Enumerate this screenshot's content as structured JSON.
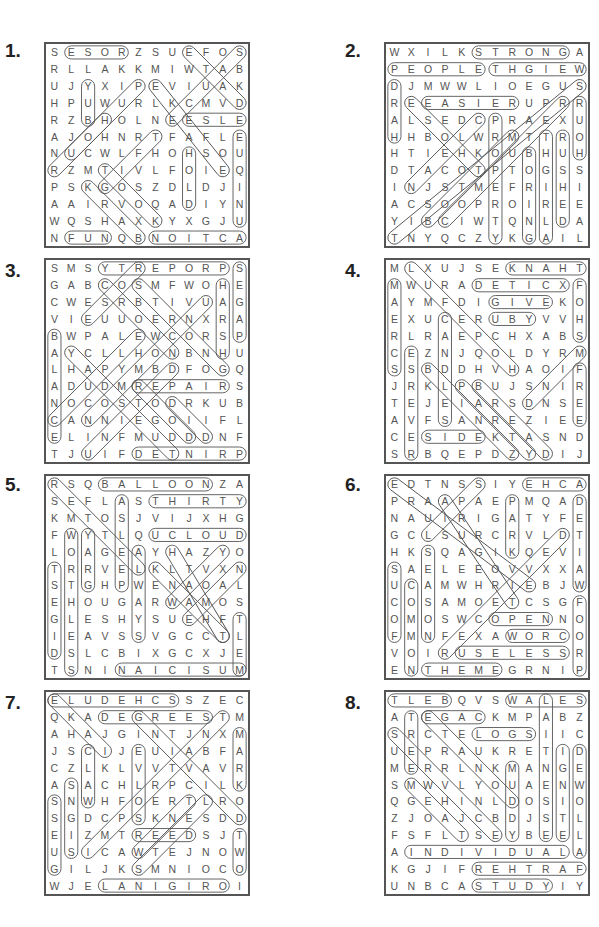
{
  "corner_text": "",
  "puzzles": [
    {
      "number": "1.",
      "rows": [
        "SESORZSUEFOS",
        "RLLAKKMIWTAB",
        "UJYXIPEVIUAK",
        "HPUWURLKCMVD",
        "RZBHOLNEESLE",
        "AJOHNRTFAFLE",
        "NUCWLFHOHSOU",
        "RZMTIVLFOIEQ",
        "PSKGOSZDLDJI",
        "AAIRVOQADIYN",
        "WQSHAXKYXGJU",
        "NFUNQBNOITCA"
      ],
      "words": [
        {
          "r1": 0,
          "c1": 1,
          "r2": 0,
          "c2": 4
        },
        {
          "r1": 0,
          "c1": 8,
          "r2": 3,
          "c2": 11
        },
        {
          "r1": 0,
          "c1": 11,
          "r2": 4,
          "c2": 7
        },
        {
          "r1": 2,
          "c1": 2,
          "r2": 4,
          "c2": 2
        },
        {
          "r1": 2,
          "c1": 6,
          "r2": 7,
          "c2": 10
        },
        {
          "r1": 2,
          "c1": 5,
          "r2": 6,
          "c2": 1
        },
        {
          "r1": 4,
          "c1": 8,
          "r2": 4,
          "c2": 11
        },
        {
          "r1": 4,
          "c1": 3,
          "r2": 7,
          "c2": 0
        },
        {
          "r1": 5,
          "c1": 11,
          "r2": 10,
          "c2": 11
        },
        {
          "r1": 5,
          "c1": 6,
          "r2": 8,
          "c2": 3
        },
        {
          "r1": 6,
          "c1": 8,
          "r2": 9,
          "c2": 8
        },
        {
          "r1": 7,
          "c1": 3,
          "r2": 10,
          "c2": 6
        },
        {
          "r1": 8,
          "c1": 2,
          "r2": 11,
          "c2": 5
        },
        {
          "r1": 11,
          "c1": 1,
          "r2": 11,
          "c2": 3
        },
        {
          "r1": 11,
          "c1": 6,
          "r2": 11,
          "c2": 11
        }
      ]
    },
    {
      "number": "2.",
      "rows": [
        "WXILKSTRONGA",
        "PEOPLETHGIEW",
        "DJMWWLIOEGUS",
        "REEASIERUPRR",
        "ALSEDCPRAEXU",
        "HHBOLWRMTTRO",
        "HTIEHKOUBHUH",
        "DTACOTPTOGSS",
        "INJSTMEFRIHI",
        "ACSOOPROIREE",
        "YIBCIWTQNLDA",
        "TNYQCZYKGAIL"
      ],
      "words": [
        {
          "r1": 0,
          "c1": 5,
          "r2": 0,
          "c2": 10
        },
        {
          "r1": 1,
          "c1": 0,
          "r2": 1,
          "c2": 5
        },
        {
          "r1": 1,
          "c1": 6,
          "r2": 1,
          "c2": 11
        },
        {
          "r1": 2,
          "c1": 0,
          "r2": 5,
          "c2": 0
        },
        {
          "r1": 3,
          "c1": 2,
          "r2": 3,
          "c2": 7
        },
        {
          "r1": 3,
          "c1": 1,
          "r2": 7,
          "c2": 5
        },
        {
          "r1": 2,
          "c1": 11,
          "r2": 11,
          "c2": 0
        },
        {
          "r1": 3,
          "c1": 11,
          "r2": 6,
          "c2": 11
        },
        {
          "r1": 4,
          "c1": 5,
          "r2": 8,
          "c2": 1
        },
        {
          "r1": 4,
          "c1": 6,
          "r2": 11,
          "c2": 6
        },
        {
          "r1": 5,
          "c1": 7,
          "r2": 10,
          "c2": 2
        },
        {
          "r1": 5,
          "c1": 9,
          "r2": 11,
          "c2": 9
        },
        {
          "r1": 5,
          "c1": 10,
          "r2": 10,
          "c2": 10
        },
        {
          "r1": 6,
          "c1": 8,
          "r2": 11,
          "c2": 8
        },
        {
          "r1": 3,
          "c1": 10,
          "r2": 10,
          "c2": 3
        }
      ]
    },
    {
      "number": "3.",
      "rows": [
        "SMSYTREPORPS",
        "GABCOSMFWOHE",
        "CWESRBTIVUAG",
        "VIEUUOERNXRA",
        "BWPALEWCORSP",
        "AYCLLHONBNHU",
        "LHAPYMBDFOGQ",
        "ADUDMREPAIRS",
        "NOCOSTODRKUB",
        "CANNIEGOIIFL",
        "ELINFMUDDDNF",
        "TJUIFDETNIRP"
      ],
      "words": [
        {
          "r1": 0,
          "c1": 3,
          "r2": 0,
          "c2": 10
        },
        {
          "r1": 0,
          "c1": 11,
          "r2": 4,
          "c2": 11
        },
        {
          "r1": 0,
          "c1": 5,
          "r2": 3,
          "c2": 2
        },
        {
          "r1": 1,
          "c1": 3,
          "r2": 5,
          "c2": 7
        },
        {
          "r1": 1,
          "c1": 5,
          "r2": 6,
          "c2": 10
        },
        {
          "r1": 1,
          "c1": 10,
          "r2": 5,
          "c2": 10
        },
        {
          "r1": 2,
          "c1": 9,
          "r2": 9,
          "c2": 2
        },
        {
          "r1": 4,
          "c1": 0,
          "r2": 10,
          "c2": 0
        },
        {
          "r1": 4,
          "c1": 5,
          "r2": 9,
          "c2": 0
        },
        {
          "r1": 5,
          "c1": 1,
          "r2": 11,
          "c2": 7
        },
        {
          "r1": 6,
          "c1": 7,
          "r2": 11,
          "c2": 2
        },
        {
          "r1": 7,
          "c1": 5,
          "r2": 7,
          "c2": 10
        },
        {
          "r1": 7,
          "c1": 5,
          "r2": 10,
          "c2": 8
        },
        {
          "r1": 8,
          "c1": 7,
          "r2": 10,
          "c2": 9
        },
        {
          "r1": 11,
          "c1": 5,
          "r2": 11,
          "c2": 11
        }
      ]
    },
    {
      "number": "4.",
      "rows": [
        "MLXUJSEKNAHT",
        "MWURADETICXF",
        "AYMFDIGIVEKO",
        "EXUCERUBYVVH",
        "RLRAEPCHXABS",
        "CEZNJQOLDYRM",
        "SSBDDHVHAOIF",
        "JRKLPBUJSNIR",
        "TEJEIARSDNSE",
        "AVFSANREZIEE",
        "CESIDEKTASND",
        "SRBQEPDZYDIJ"
      ],
      "words": [
        {
          "r1": 0,
          "c1": 7,
          "r2": 0,
          "c2": 11
        },
        {
          "r1": 1,
          "c1": 5,
          "r2": 1,
          "c2": 10
        },
        {
          "r1": 1,
          "c1": 11,
          "r2": 4,
          "c2": 11
        },
        {
          "r1": 1,
          "c1": 0,
          "r2": 6,
          "c2": 0
        },
        {
          "r1": 0,
          "c1": 1,
          "r2": 6,
          "c2": 7
        },
        {
          "r1": 2,
          "c1": 6,
          "r2": 2,
          "c2": 9
        },
        {
          "r1": 3,
          "c1": 6,
          "r2": 3,
          "c2": 8
        },
        {
          "r1": 3,
          "c1": 3,
          "r2": 9,
          "c2": 3
        },
        {
          "r1": 5,
          "c1": 1,
          "r2": 11,
          "c2": 1
        },
        {
          "r1": 5,
          "c1": 11,
          "r2": 8,
          "c2": 8
        },
        {
          "r1": 6,
          "c1": 11,
          "r2": 9,
          "c2": 11
        },
        {
          "r1": 6,
          "c1": 2,
          "r2": 11,
          "c2": 7
        },
        {
          "r1": 7,
          "c1": 4,
          "r2": 11,
          "c2": 8
        },
        {
          "r1": 7,
          "c1": 5,
          "r2": 11,
          "c2": 9
        },
        {
          "r1": 10,
          "c1": 2,
          "r2": 10,
          "c2": 5
        }
      ]
    },
    {
      "number": "5.",
      "rows": [
        "RSQBALLOONZA",
        "SEFLASTHIRTY",
        "KMTOSJVIJXHG",
        "FWYTLQUCLOUD",
        "LOAGEAYHAZYO",
        "TRRVELKLTVXN",
        "STGHPWENAOAL",
        "EHOUGARWAMOS",
        "GLESHYSUEHFT",
        "IEAVSSVGCCTL",
        "DSLCBIXGCXJE",
        "TSNINAICISUM"
      ],
      "words": [
        {
          "r1": 0,
          "c1": 3,
          "r2": 0,
          "c2": 9
        },
        {
          "r1": 0,
          "c1": 0,
          "r2": 5,
          "c2": 5
        },
        {
          "r1": 1,
          "c1": 6,
          "r2": 1,
          "c2": 11
        },
        {
          "r1": 1,
          "c1": 4,
          "r2": 6,
          "c2": 4
        },
        {
          "r1": 3,
          "c1": 6,
          "r2": 3,
          "c2": 11
        },
        {
          "r1": 3,
          "c1": 1,
          "r2": 11,
          "c2": 1
        },
        {
          "r1": 3,
          "c1": 2,
          "r2": 6,
          "c2": 2
        },
        {
          "r1": 4,
          "c1": 5,
          "r2": 9,
          "c2": 5
        },
        {
          "r1": 4,
          "c1": 7,
          "r2": 9,
          "c2": 10
        },
        {
          "r1": 4,
          "c1": 10,
          "r2": 7,
          "c2": 7
        },
        {
          "r1": 5,
          "c1": 6,
          "r2": 9,
          "c2": 10
        },
        {
          "r1": 5,
          "c1": 11,
          "r2": 8,
          "c2": 8
        },
        {
          "r1": 5,
          "c1": 0,
          "r2": 10,
          "c2": 0
        },
        {
          "r1": 8,
          "c1": 11,
          "r2": 11,
          "c2": 11
        },
        {
          "r1": 11,
          "c1": 4,
          "r2": 11,
          "c2": 11
        }
      ]
    },
    {
      "number": "6.",
      "rows": [
        "EDTNSSIYEHCA",
        "PRAAPAEPMQAD",
        "NAUIRIGATYFE",
        "GCLSURCRVLDT",
        "HKSQAGIKQEVI",
        "SAELEEOVVXXA",
        "UCAMWHRIEBJW",
        "COSAMOETCSGF",
        "OMOSWCOPENNO",
        "FMNFEXAWORCO",
        "VOIRUSELESSR",
        "ENTHEMEGRNIP"
      ],
      "words": [
        {
          "r1": 0,
          "c1": 0,
          "r2": 6,
          "c2": 8
        },
        {
          "r1": 0,
          "c1": 5,
          "r2": 3,
          "c2": 2
        },
        {
          "r1": 0,
          "c1": 8,
          "r2": 0,
          "c2": 11
        },
        {
          "r1": 1,
          "c1": 3,
          "r2": 7,
          "c2": 7
        },
        {
          "r1": 1,
          "c1": 7,
          "r2": 4,
          "c2": 7
        },
        {
          "r1": 1,
          "c1": 11,
          "r2": 6,
          "c2": 11
        },
        {
          "r1": 3,
          "c1": 10,
          "r2": 10,
          "c2": 3
        },
        {
          "r1": 4,
          "c1": 2,
          "r2": 9,
          "c2": 2
        },
        {
          "r1": 5,
          "c1": 0,
          "r2": 9,
          "c2": 0
        },
        {
          "r1": 6,
          "c1": 1,
          "r2": 11,
          "c2": 1
        },
        {
          "r1": 7,
          "c1": 11,
          "r2": 11,
          "c2": 11
        },
        {
          "r1": 8,
          "c1": 6,
          "r2": 8,
          "c2": 9
        },
        {
          "r1": 9,
          "c1": 7,
          "r2": 9,
          "c2": 10
        },
        {
          "r1": 10,
          "c1": 4,
          "r2": 10,
          "c2": 10
        },
        {
          "r1": 11,
          "c1": 2,
          "r2": 11,
          "c2": 6
        }
      ]
    },
    {
      "number": "7.",
      "rows": [
        "ELUDEHCSSZEC",
        "QKADEGREESTM",
        "AHAJGINTJNXM",
        "JSCIJEUIABFA",
        "CZLKLVVTVAVR",
        "ASACHLRPCILK",
        "SNWHFOERTLRO",
        "SGDCPSKNESDD",
        "EIZMTREEDSJT",
        "USICAWTEJNOW",
        "GILJKSMNIOCO",
        "WJELANIGIROI"
      ],
      "words": [
        {
          "r1": 0,
          "c1": 0,
          "r2": 0,
          "c2": 7
        },
        {
          "r1": 0,
          "c1": 0,
          "r2": 3,
          "c2": 3
        },
        {
          "r1": 1,
          "c1": 3,
          "r2": 1,
          "c2": 9
        },
        {
          "r1": 1,
          "c1": 5,
          "r2": 7,
          "c2": 11
        },
        {
          "r1": 1,
          "c1": 10,
          "r2": 9,
          "c2": 2
        },
        {
          "r1": 2,
          "c1": 11,
          "r2": 5,
          "c2": 11
        },
        {
          "r1": 3,
          "c1": 2,
          "r2": 6,
          "c2": 2
        },
        {
          "r1": 3,
          "c1": 5,
          "r2": 7,
          "c2": 5
        },
        {
          "r1": 5,
          "c1": 1,
          "r2": 9,
          "c2": 1
        },
        {
          "r1": 6,
          "c1": 0,
          "r2": 10,
          "c2": 0
        },
        {
          "r1": 6,
          "c1": 8,
          "r2": 9,
          "c2": 5
        },
        {
          "r1": 6,
          "c1": 9,
          "r2": 10,
          "c2": 5
        },
        {
          "r1": 8,
          "c1": 5,
          "r2": 8,
          "c2": 8
        },
        {
          "r1": 8,
          "c1": 11,
          "r2": 10,
          "c2": 11
        },
        {
          "r1": 11,
          "c1": 3,
          "r2": 11,
          "c2": 10
        }
      ]
    },
    {
      "number": "8.",
      "rows": [
        "TLEBQVSWALES",
        "ATEGACKMPABZ",
        "SRCTELOGSIIC",
        "UEPRAUKRETID",
        "MERRLNKMANGE",
        "SMWVLYOUAENW",
        "QGEHINLDOSIO",
        "ZJOAJCBDJSTL",
        "FSFLTSEYBEEL",
        "AINDIVIDUALA",
        "KGJIFREHTRAF",
        "UNBCASTUDYIY"
      ],
      "words": [
        {
          "r1": 0,
          "c1": 0,
          "r2": 0,
          "c2": 3
        },
        {
          "r1": 0,
          "c1": 7,
          "r2": 0,
          "c2": 11
        },
        {
          "r1": 0,
          "c1": 9,
          "r2": 8,
          "c2": 9
        },
        {
          "r1": 1,
          "c1": 1,
          "r2": 4,
          "c2": 1
        },
        {
          "r1": 1,
          "c1": 2,
          "r2": 1,
          "c2": 5
        },
        {
          "r1": 1,
          "c1": 2,
          "r2": 6,
          "c2": 7
        },
        {
          "r1": 2,
          "c1": 5,
          "r2": 2,
          "c2": 8
        },
        {
          "r1": 2,
          "c1": 0,
          "r2": 8,
          "c2": 6
        },
        {
          "r1": 3,
          "c1": 10,
          "r2": 8,
          "c2": 10
        },
        {
          "r1": 3,
          "c1": 11,
          "r2": 9,
          "c2": 11
        },
        {
          "r1": 4,
          "c1": 7,
          "r2": 8,
          "c2": 7
        },
        {
          "r1": 5,
          "c1": 1,
          "r2": 8,
          "c2": 4
        },
        {
          "r1": 9,
          "c1": 1,
          "r2": 9,
          "c2": 10
        },
        {
          "r1": 10,
          "c1": 5,
          "r2": 10,
          "c2": 11
        },
        {
          "r1": 11,
          "c1": 5,
          "r2": 11,
          "c2": 9
        }
      ]
    }
  ]
}
